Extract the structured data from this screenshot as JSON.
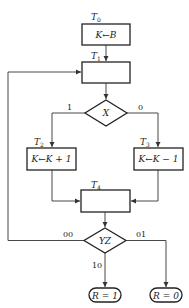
{
  "diagram": {
    "type": "ASM flowchart",
    "states": {
      "T0": {
        "name": "T",
        "sub": "0",
        "action": "K←B"
      },
      "T1": {
        "name": "T",
        "sub": "1",
        "action": ""
      },
      "T2": {
        "name": "T",
        "sub": "2",
        "action": "K←K + 1"
      },
      "T3": {
        "name": "T",
        "sub": "3",
        "action": "K←K − 1"
      },
      "T4": {
        "name": "T",
        "sub": "4",
        "action": ""
      }
    },
    "decisions": {
      "X": {
        "label": "X",
        "branch_left": "1",
        "branch_right": "0"
      },
      "YZ": {
        "label": "YZ",
        "branch_left": "00",
        "branch_down": "10",
        "branch_right": "01"
      }
    },
    "outputs": {
      "r1": "R = 1",
      "r0": "R = 0"
    }
  }
}
